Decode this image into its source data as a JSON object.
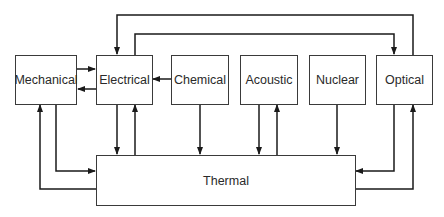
{
  "diagram": {
    "type": "energy-conversion-block-diagram",
    "nodes": {
      "mechanical": {
        "label": "Mechanical"
      },
      "electrical": {
        "label": "Electrical"
      },
      "chemical": {
        "label": "Chemical"
      },
      "acoustic": {
        "label": "Acoustic"
      },
      "nuclear": {
        "label": "Nuclear"
      },
      "optical": {
        "label": "Optical"
      },
      "thermal": {
        "label": "Thermal"
      }
    },
    "edges": [
      {
        "from": "Mechanical",
        "to": "Electrical"
      },
      {
        "from": "Electrical",
        "to": "Mechanical"
      },
      {
        "from": "Chemical",
        "to": "Electrical"
      },
      {
        "from": "Optical",
        "to": "Electrical"
      },
      {
        "from": "Electrical",
        "to": "Optical"
      },
      {
        "from": "Mechanical",
        "to": "Thermal"
      },
      {
        "from": "Thermal",
        "to": "Mechanical"
      },
      {
        "from": "Electrical",
        "to": "Thermal"
      },
      {
        "from": "Thermal",
        "to": "Electrical"
      },
      {
        "from": "Chemical",
        "to": "Thermal"
      },
      {
        "from": "Acoustic",
        "to": "Thermal"
      },
      {
        "from": "Thermal",
        "to": "Acoustic"
      },
      {
        "from": "Nuclear",
        "to": "Thermal"
      },
      {
        "from": "Optical",
        "to": "Thermal"
      },
      {
        "from": "Thermal",
        "to": "Optical"
      }
    ],
    "colors": {
      "line": "#1a1a1a",
      "box_border": "#3a3a3a",
      "text": "#2a2a2a",
      "background": "#ffffff"
    }
  }
}
